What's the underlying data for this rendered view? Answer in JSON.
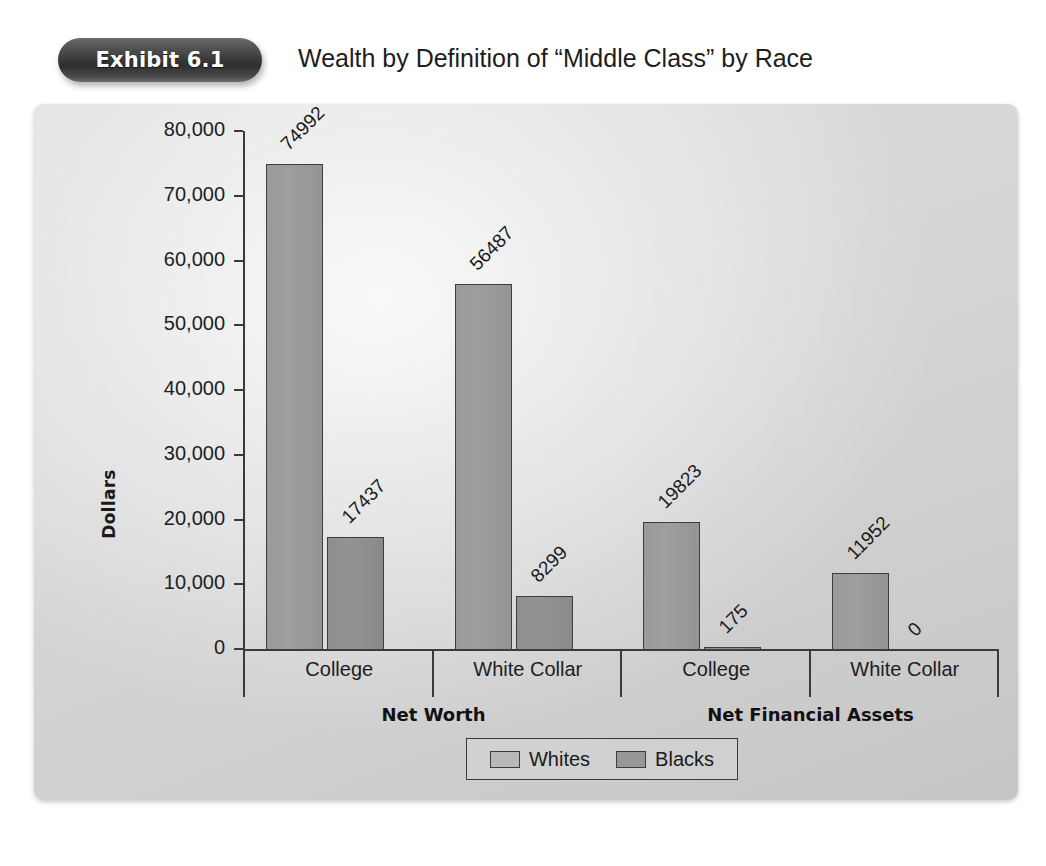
{
  "header": {
    "exhibit_badge": "Exhibit 6.1",
    "title": "Wealth by Definition of “Middle Class” by Race"
  },
  "chart_data": {
    "type": "bar",
    "title": "Wealth by Definition of “Middle Class” by Race",
    "xlabel": "",
    "ylabel": "Dollars",
    "ylim": [
      0,
      80000
    ],
    "ytick_labels": [
      "80,000",
      "70,000",
      "60,000",
      "50,000",
      "40,000",
      "30,000",
      "20,000",
      "10,000",
      "0"
    ],
    "ytick_values": [
      80000,
      70000,
      60000,
      50000,
      40000,
      30000,
      20000,
      10000,
      0
    ],
    "grid": false,
    "legend_position": "bottom-center",
    "categories": [
      "College",
      "White Collar",
      "College",
      "White Collar"
    ],
    "groups": [
      {
        "name": "Net Worth",
        "categories": [
          "College",
          "White Collar"
        ]
      },
      {
        "name": "Net Financial Assets",
        "categories": [
          "College",
          "White Collar"
        ]
      }
    ],
    "series": [
      {
        "name": "Whites",
        "color": "#9a9a9a",
        "values": [
          74992,
          56487,
          19823,
          11952
        ]
      },
      {
        "name": "Blacks",
        "color": "#8f8f8f",
        "values": [
          17437,
          8299,
          175,
          0
        ]
      }
    ],
    "bars": [
      {
        "group": "Net Worth",
        "category": "College",
        "series": "Whites",
        "value": 74992,
        "label": "74992"
      },
      {
        "group": "Net Worth",
        "category": "College",
        "series": "Blacks",
        "value": 17437,
        "label": "17437"
      },
      {
        "group": "Net Worth",
        "category": "White Collar",
        "series": "Whites",
        "value": 56487,
        "label": "56487"
      },
      {
        "group": "Net Worth",
        "category": "White Collar",
        "series": "Blacks",
        "value": 8299,
        "label": "8299"
      },
      {
        "group": "Net Financial Assets",
        "category": "College",
        "series": "Whites",
        "value": 19823,
        "label": "19823"
      },
      {
        "group": "Net Financial Assets",
        "category": "College",
        "series": "Blacks",
        "value": 175,
        "label": "175"
      },
      {
        "group": "Net Financial Assets",
        "category": "White Collar",
        "series": "Whites",
        "value": 11952,
        "label": "11952"
      },
      {
        "group": "Net Financial Assets",
        "category": "White Collar",
        "series": "Blacks",
        "value": 0,
        "label": "0"
      }
    ],
    "legend": [
      {
        "label": "Whites",
        "color": "#b9b9b9"
      },
      {
        "label": "Blacks",
        "color": "#989898"
      }
    ]
  }
}
